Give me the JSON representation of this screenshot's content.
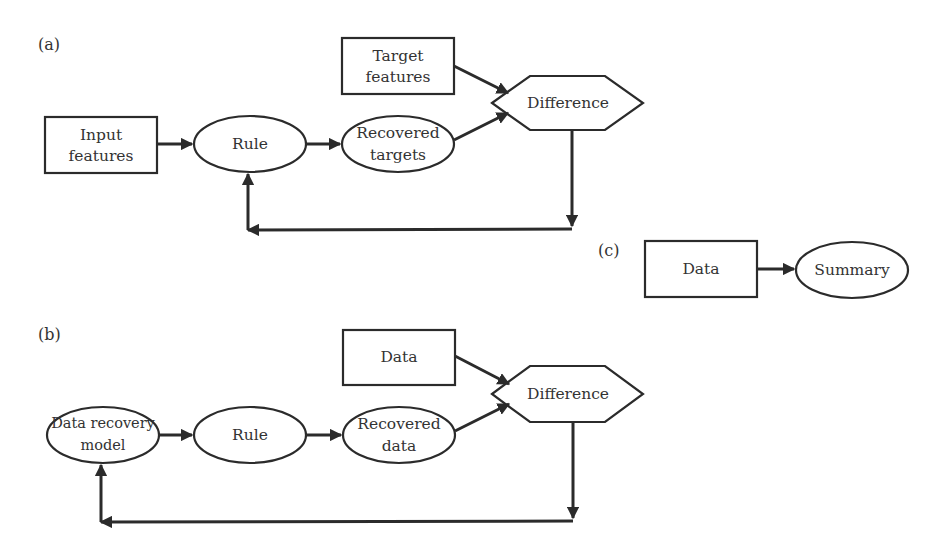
{
  "panels": {
    "a": {
      "label": "(a)",
      "nodes": {
        "input": {
          "line1": "Input",
          "line2": "features",
          "shape": "rectangle"
        },
        "rule": {
          "label": "Rule",
          "shape": "ellipse"
        },
        "recovered": {
          "line1": "Recovered",
          "line2": "targets",
          "shape": "ellipse"
        },
        "target": {
          "line1": "Target",
          "line2": "features",
          "shape": "rectangle"
        },
        "difference": {
          "label": "Difference",
          "shape": "hexagon"
        }
      },
      "edges": [
        {
          "from": "Input features",
          "to": "Rule"
        },
        {
          "from": "Rule",
          "to": "Recovered targets"
        },
        {
          "from": "Recovered targets",
          "to": "Difference"
        },
        {
          "from": "Target features",
          "to": "Difference"
        },
        {
          "from": "Difference",
          "to": "Rule",
          "type": "feedback"
        }
      ]
    },
    "b": {
      "label": "(b)",
      "nodes": {
        "model": {
          "line1": "Data recovery",
          "line2": "model",
          "shape": "ellipse"
        },
        "rule": {
          "label": "Rule",
          "shape": "ellipse"
        },
        "recovered": {
          "line1": "Recovered",
          "line2": "data",
          "shape": "ellipse"
        },
        "data": {
          "label": "Data",
          "shape": "rectangle"
        },
        "difference": {
          "label": "Difference",
          "shape": "hexagon"
        }
      },
      "edges": [
        {
          "from": "Data recovery model",
          "to": "Rule"
        },
        {
          "from": "Rule",
          "to": "Recovered data"
        },
        {
          "from": "Recovered data",
          "to": "Difference"
        },
        {
          "from": "Data",
          "to": "Difference"
        },
        {
          "from": "Difference",
          "to": "Data recovery model",
          "type": "feedback"
        }
      ]
    },
    "c": {
      "label": "(c)",
      "nodes": {
        "data": {
          "label": "Data",
          "shape": "rectangle"
        },
        "summary": {
          "label": "Summary",
          "shape": "ellipse"
        }
      },
      "edges": [
        {
          "from": "Data",
          "to": "Summary"
        }
      ]
    }
  }
}
